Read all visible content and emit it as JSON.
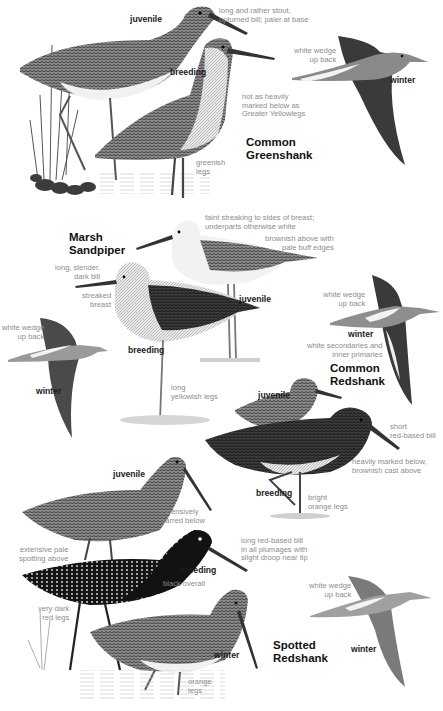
{
  "species": [
    {
      "name_line1": "Common",
      "name_line2": "Greenshank",
      "ages": {
        "juvenile": "juvenile",
        "breeding": "breeding",
        "winter": "winter"
      },
      "notes": {
        "bill": "long and rather stout, upturned bill; paler at base",
        "bill_l1": "long and rather stout,",
        "bill_l2": "upturned bill; paler at base",
        "back_l1": "white wedge",
        "back_l2": "up back",
        "below_l1": "not as heavily",
        "below_l2": "marked below as",
        "below_l3": "Greater Yellowlegs",
        "legs_l1": "greenish",
        "legs_l2": "legs"
      }
    },
    {
      "name_line1": "Marsh",
      "name_line2": "Sandpiper",
      "ages": {
        "juvenile": "juvenile",
        "breeding": "breeding",
        "winter": "winter"
      },
      "notes": {
        "breast_l1": "faint streaking to sides of breast;",
        "breast_l2": "underparts otherwise white",
        "above_l1": "brownish above with",
        "above_l2": "pale buff edges",
        "bill_l1": "long, slender,",
        "bill_l2": "dark bill",
        "streak_l1": "streaked",
        "streak_l2": "breast",
        "back_l1": "white wedge",
        "back_l2": "up back",
        "legs_l1": "long",
        "legs_l2": "yellowish legs"
      }
    },
    {
      "name_line1": "Common",
      "name_line2": "Redshank",
      "ages": {
        "juvenile": "juvenile",
        "breeding": "breeding",
        "winter": "winter"
      },
      "notes": {
        "back_l1": "white wedge",
        "back_l2": "up back",
        "wing_l1": "white secondaries and",
        "wing_l2": "inner primaries",
        "bill_l1": "short",
        "bill_l2": "red-based bill",
        "below_l1": "heavily marked below,",
        "below_l2": "brownish cast above",
        "legs_l1": "bright",
        "legs_l2": "orange legs"
      }
    },
    {
      "name_line1": "Spotted",
      "name_line2": "Redshank",
      "ages": {
        "juvenile": "juvenile",
        "breeding": "breeding",
        "winter": "winter",
        "winter_flight": "winter"
      },
      "notes": {
        "barred_l1": "extensively",
        "barred_l2": "barred below",
        "spot_l1": "extensive pale",
        "spot_l2": "spotting above",
        "bill_l1": "long red-based bill",
        "bill_l2": "in all plumages with",
        "bill_l3": "slight droop near tip",
        "black": "black overall",
        "dark_legs_l1": "very dark",
        "dark_legs_l2": "red legs",
        "back_l1": "white wedge",
        "back_l2": "up back",
        "orange_l1": "orange",
        "orange_l2": "legs"
      }
    }
  ],
  "colors": {
    "label": "#1a1a1a",
    "note": "#8c8c8c",
    "bird_dark": "#2a2a2a",
    "bird_mid": "#6e6e6e",
    "bird_light": "#cfcfcf"
  }
}
